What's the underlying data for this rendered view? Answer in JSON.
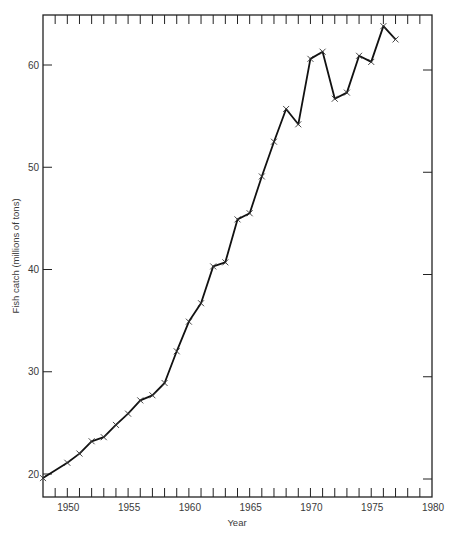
{
  "chart_data": {
    "type": "line",
    "title": "",
    "xlabel": "Year",
    "ylabel": "Fish catch (millions of tons)",
    "xlim": [
      1948,
      1980
    ],
    "ylim": [
      18.2,
      65.5
    ],
    "grid": false,
    "legend": null,
    "marker": "x",
    "x_tick_labels": [
      "1950",
      "1955",
      "1960",
      "1965",
      "1970",
      "1975",
      "1980"
    ],
    "x_ticks": [
      1950,
      1955,
      1960,
      1965,
      1970,
      1975,
      1980
    ],
    "x_minor_ticks_every": 1,
    "y_tick_labels": [
      "20",
      "30",
      "40",
      "50",
      "60"
    ],
    "y_ticks": [
      20,
      30,
      40,
      50,
      60
    ],
    "series": [
      {
        "name": "Fish catch",
        "x": [
          1948,
          1950,
          1951,
          1952,
          1953,
          1954,
          1955,
          1956,
          1957,
          1958,
          1959,
          1960,
          1961,
          1962,
          1963,
          1964,
          1965,
          1966,
          1967,
          1968,
          1969,
          1970,
          1971,
          1972,
          1973,
          1974,
          1975,
          1976,
          1977
        ],
        "values": [
          19.6,
          21.1,
          22.0,
          23.2,
          23.6,
          24.8,
          25.9,
          27.2,
          27.7,
          28.9,
          32.0,
          34.9,
          36.7,
          40.3,
          40.7,
          44.9,
          45.5,
          49.1,
          52.5,
          55.7,
          54.2,
          60.6,
          61.3,
          56.7,
          57.3,
          60.9,
          60.3,
          63.8,
          62.5
        ]
      }
    ]
  },
  "colors": {
    "line": "#111111",
    "axis": "#222222",
    "text": "#3a3a3a",
    "background": "#ffffff"
  }
}
